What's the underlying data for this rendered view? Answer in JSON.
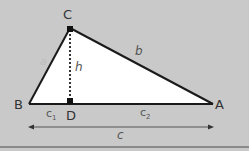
{
  "diagram": {
    "vertices": {
      "A": "A",
      "B": "B",
      "C": "C",
      "D": "D"
    },
    "sides": {
      "a": "a",
      "b": "b",
      "c": "c",
      "c1": "c",
      "c1_sub": "1",
      "c2": "c",
      "c2_sub": "2",
      "h": "h"
    },
    "colors": {
      "background": "#c9c9c9",
      "triangle_fill": "#ffffff",
      "line": "#1a1a1a",
      "arrow": "#555555",
      "bottom_border": "#8a8a8a"
    }
  }
}
